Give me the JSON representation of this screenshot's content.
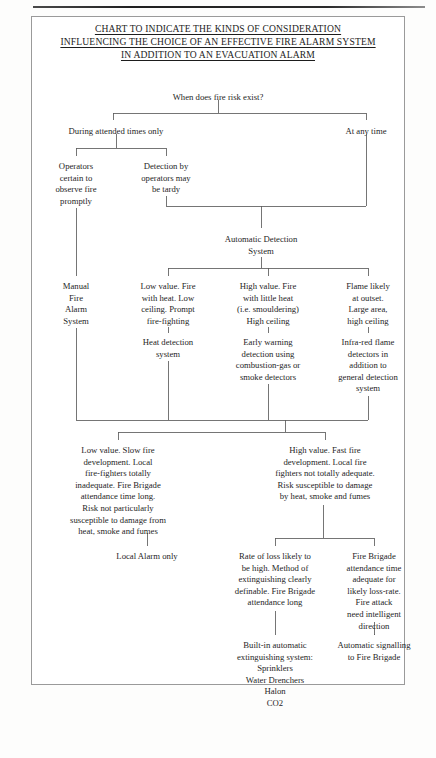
{
  "document": {
    "title_lines": [
      "CHART TO INDICATE THE KINDS OF CONSIDERATION",
      "INFLUENCING THE CHOICE OF AN EFFECTIVE FIRE ALARM SYSTEM",
      "IN ADDITION TO AN EVACUATION ALARM"
    ]
  },
  "colors": {
    "page_background": "#fdfdfc",
    "frame_border": "#9a9a9a",
    "connector_line": "#5d5d5d",
    "text": "#262626",
    "title_text": "#1d1d1d",
    "top_rule": "#1f1f1f"
  },
  "chart_data": {
    "type": "diagram",
    "title": "CHART TO INDICATE THE KINDS OF CONSIDERATION INFLUENCING THE CHOICE OF AN EFFECTIVE FIRE ALARM SYSTEM IN ADDITION TO AN EVACUATION ALARM",
    "orientation": "top-down",
    "nodes": [
      {
        "id": "root",
        "text": "When does fire risk exist?",
        "x": 218,
        "y": 92,
        "w": 170
      },
      {
        "id": "attended",
        "text": "During attended times only",
        "x": 116,
        "y": 126,
        "w": 150
      },
      {
        "id": "anytime",
        "text": "At any time",
        "x": 366,
        "y": 126,
        "w": 78
      },
      {
        "id": "operators-certain",
        "text": "Operators\ncertain to\nobserve fire\npromptly",
        "x": 76,
        "y": 161,
        "w": 74
      },
      {
        "id": "detection-tardy",
        "text": "Detection by\noperators may\nbe tardy",
        "x": 166,
        "y": 161,
        "w": 84
      },
      {
        "id": "auto-detection",
        "text": "Automatic Detection\nSystem",
        "x": 261,
        "y": 234,
        "w": 124
      },
      {
        "id": "manual-alarm",
        "text": "Manual\nFire\nAlarm\nSystem",
        "x": 76,
        "y": 281,
        "w": 66
      },
      {
        "id": "low-value-heat",
        "text": "Low value. Fire\nwith heat. Low\nceiling. Prompt\nfire-fighting",
        "x": 168,
        "y": 281,
        "w": 92
      },
      {
        "id": "high-value-heat",
        "text": "High value. Fire\nwith little heat\n(i.e. smouldering)\nHigh ceiling",
        "x": 268,
        "y": 281,
        "w": 98
      },
      {
        "id": "flame-outset",
        "text": "Flame likely\nat outset.\nLarge area,\nhigh ceiling",
        "x": 368,
        "y": 281,
        "w": 84
      },
      {
        "id": "heat-detection",
        "text": "Heat detection\nsystem",
        "x": 168,
        "y": 337,
        "w": 92
      },
      {
        "id": "early-warning",
        "text": "Early warning\ndetection using\ncombustion-gas or\nsmoke detectors",
        "x": 268,
        "y": 337,
        "w": 100
      },
      {
        "id": "infra-red",
        "text": "Infra-red flame\ndetectors in\naddition to\ngeneral detection\nsystem",
        "x": 368,
        "y": 337,
        "w": 94
      },
      {
        "id": "low-value-slow",
        "text": "Low value. Slow fire\ndevelopment. Local\nfire-fighters totally\ninadequate. Fire Brigade\nattendance time long.\nRisk not particularly\nsusceptible to damage from\nheat, smoke and fumes",
        "x": 118,
        "y": 445,
        "w": 160
      },
      {
        "id": "high-value-fast",
        "text": "High value. Fast fire\ndevelopment. Local fire\nfighters not totally adequate.\nRisk susceptible to damage\nby heat, smoke and fumes",
        "x": 325,
        "y": 445,
        "w": 162
      },
      {
        "id": "local-alarm",
        "text": "Local Alarm only",
        "x": 147,
        "y": 551,
        "w": 110
      },
      {
        "id": "rate-of-loss",
        "text": "Rate of loss likely to\nbe high. Method of\nextinguishing clearly\ndefinable. Fire Brigade\nattendance long",
        "x": 275,
        "y": 551,
        "w": 116
      },
      {
        "id": "brigade-adequate",
        "text": "Fire Brigade\nattendance time\nadequate for\nlikely loss-rate.\nFire attack\nneed intelligent\ndirection",
        "x": 374,
        "y": 551,
        "w": 100
      },
      {
        "id": "built-in-system",
        "text": "Built-in automatic\nextinguishing system:\nSprinklers\nWater Drenchers\nHalon\nCO2",
        "x": 275,
        "y": 640,
        "w": 120
      },
      {
        "id": "auto-signalling",
        "text": "Automatic signalling\nto Fire Brigade",
        "x": 374,
        "y": 640,
        "w": 108
      }
    ],
    "edges": [
      {
        "from": "root",
        "to": "attended"
      },
      {
        "from": "root",
        "to": "anytime"
      },
      {
        "from": "attended",
        "to": "operators-certain"
      },
      {
        "from": "attended",
        "to": "detection-tardy"
      },
      {
        "from": "detection-tardy",
        "to": "auto-detection"
      },
      {
        "from": "anytime",
        "to": "auto-detection"
      },
      {
        "from": "operators-certain",
        "to": "manual-alarm"
      },
      {
        "from": "auto-detection",
        "to": "low-value-heat"
      },
      {
        "from": "auto-detection",
        "to": "high-value-heat"
      },
      {
        "from": "auto-detection",
        "to": "flame-outset"
      },
      {
        "from": "low-value-heat",
        "to": "heat-detection"
      },
      {
        "from": "high-value-heat",
        "to": "early-warning"
      },
      {
        "from": "flame-outset",
        "to": "infra-red"
      },
      {
        "from": "manual-alarm",
        "to": "low-value-slow"
      },
      {
        "from": "heat-detection",
        "to": "low-value-slow"
      },
      {
        "from": "early-warning",
        "to": "high-value-fast"
      },
      {
        "from": "infra-red",
        "to": "high-value-fast"
      },
      {
        "from": "low-value-slow",
        "to": "local-alarm"
      },
      {
        "from": "high-value-fast",
        "to": "rate-of-loss"
      },
      {
        "from": "high-value-fast",
        "to": "brigade-adequate"
      },
      {
        "from": "rate-of-loss",
        "to": "built-in-system"
      },
      {
        "from": "brigade-adequate",
        "to": "auto-signalling"
      }
    ]
  }
}
